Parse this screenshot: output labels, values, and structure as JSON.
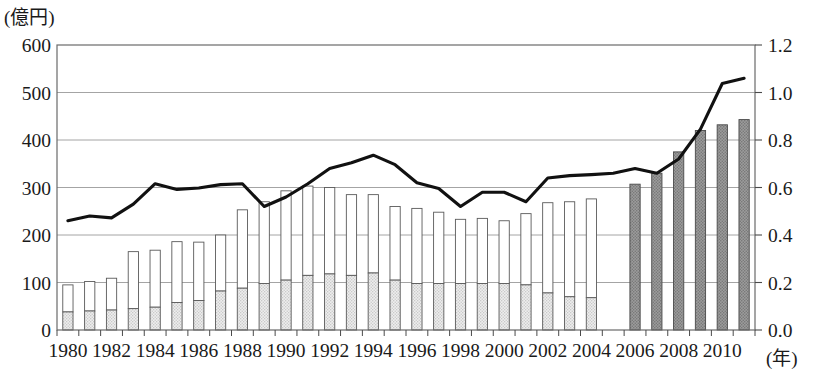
{
  "chart_data": {
    "type": "bar",
    "title": "",
    "xlabel": "(年)",
    "ylabel": "(億円)",
    "ylim": [
      0,
      600
    ],
    "ylim_right": [
      0.0,
      1.2
    ],
    "yticks": [
      "0",
      "100",
      "200",
      "300",
      "400",
      "500",
      "600"
    ],
    "yticks_right": [
      "0.0",
      "0.2",
      "0.4",
      "0.6",
      "0.8",
      "1.0",
      "1.2"
    ],
    "grid": true,
    "legend_position": "none",
    "categories": [
      "1980",
      "1981",
      "1982",
      "1983",
      "1984",
      "1985",
      "1986",
      "1987",
      "1988",
      "1989",
      "1990",
      "1991",
      "1992",
      "1993",
      "1994",
      "1995",
      "1996",
      "1997",
      "1998",
      "1999",
      "2000",
      "2001",
      "2002",
      "2003",
      "2004",
      "2005",
      "2006",
      "2007",
      "2008",
      "2009",
      "2010",
      "2011"
    ],
    "xtick_labels": [
      "1980",
      "",
      "1982",
      "",
      "1984",
      "",
      "1986",
      "",
      "1988",
      "",
      "1990",
      "",
      "1992",
      "",
      "1994",
      "",
      "1996",
      "",
      "1998",
      "",
      "2000",
      "",
      "2002",
      "",
      "2004",
      "",
      "2006",
      "",
      "2008",
      "",
      "2010",
      ""
    ],
    "series": [
      {
        "name": "下段（網掛け薄灰）",
        "style": "hatched-light",
        "color": "#dedede",
        "values": [
          38,
          40,
          42,
          45,
          48,
          58,
          62,
          82,
          88,
          98,
          105,
          115,
          118,
          115,
          120,
          105,
          98,
          98,
          98,
          98,
          98,
          95,
          78,
          70,
          68,
          0,
          0,
          0,
          0,
          0,
          0,
          0
        ]
      },
      {
        "name": "上段（白）",
        "style": "open-white",
        "color": "#ffffff",
        "values": [
          57,
          62,
          67,
          120,
          120,
          128,
          123,
          118,
          165,
          172,
          188,
          188,
          182,
          170,
          165,
          155,
          158,
          150,
          135,
          137,
          132,
          150,
          190,
          200,
          208,
          0,
          0,
          0,
          0,
          0,
          0,
          0
        ]
      },
      {
        "name": "合計（網掛け濃灰）",
        "style": "hatched-dark",
        "color": "#8e8e8e",
        "values": [
          0,
          0,
          0,
          0,
          0,
          0,
          0,
          0,
          0,
          0,
          0,
          0,
          0,
          0,
          0,
          0,
          0,
          0,
          0,
          0,
          0,
          0,
          0,
          0,
          0,
          0,
          307,
          330,
          375,
          420,
          432,
          443
        ]
      }
    ],
    "bar_totals": [
      95,
      102,
      109,
      165,
      168,
      186,
      185,
      200,
      253,
      270,
      293,
      303,
      300,
      285,
      285,
      260,
      256,
      248,
      233,
      235,
      230,
      245,
      268,
      270,
      276,
      0,
      307,
      330,
      375,
      420,
      432,
      443
    ],
    "line": {
      "name": "指数（右軸）",
      "axis": "right",
      "color": "#111111",
      "values": [
        0.46,
        0.48,
        0.47,
        0.53,
        0.62,
        0.59,
        0.6,
        0.61,
        0.62,
        0.52,
        0.56,
        0.62,
        0.68,
        0.7,
        0.74,
        0.7,
        0.62,
        0.6,
        0.52,
        0.58,
        0.58,
        0.54,
        0.64,
        0.65,
        0.65,
        0.66,
        0.68,
        0.66,
        0.72,
        0.85,
        1.04,
        1.06
      ],
      "values_left_scale": [
        230,
        240,
        236,
        265,
        308,
        296,
        299,
        306,
        308,
        260,
        280,
        308,
        340,
        352,
        368,
        348,
        310,
        298,
        260,
        290,
        290,
        270,
        320,
        325,
        327,
        330,
        340,
        330,
        360,
        423,
        519,
        530
      ]
    }
  }
}
